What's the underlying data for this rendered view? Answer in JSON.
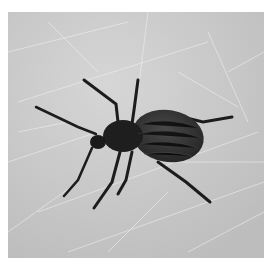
{
  "image": {
    "subject": "beetle",
    "description": "Black-and-white photograph of a dark weevil-like beetle on a scratched light gray surface",
    "colors": {
      "background": "#ffffff",
      "surface": "#c9c9c9",
      "scratch": "#e6e6e6",
      "beetle_body": "#1e1e1e",
      "beetle_elytra": "#3a3a3a"
    }
  }
}
